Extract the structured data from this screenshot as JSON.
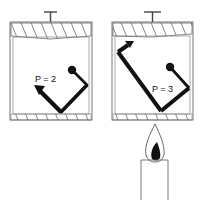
{
  "diagram": {
    "containers": [
      {
        "id": "left",
        "pressure_label": "P = 2",
        "heated": false
      },
      {
        "id": "right",
        "pressure_label": "P = 3",
        "heated": true
      }
    ],
    "heat_source": {
      "type": "candle"
    },
    "colors": {
      "stroke": "#333333",
      "fill": "#111111",
      "background": "#ffffff"
    }
  }
}
